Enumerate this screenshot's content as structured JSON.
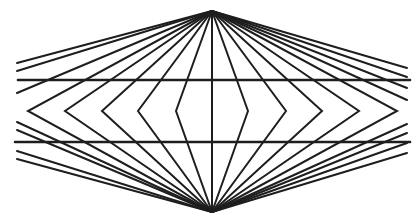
{
  "colors": {
    "stroke": "#1e1e1e",
    "background": "#ffffff"
  },
  "apex_top": [
    212,
    11
  ],
  "apex_bottom": [
    212,
    212
  ],
  "horizontal_lines": [
    {
      "y": 80,
      "x1": 18,
      "x2": 410
    },
    {
      "y": 142,
      "x1": 15,
      "x2": 410
    }
  ],
  "chevrons": {
    "mid_y": 111,
    "left_apex_x": [
      28,
      65,
      102,
      138,
      176
    ],
    "center_x": 212,
    "right_apex_x": [
      248,
      286,
      322,
      359,
      397
    ]
  },
  "outer_rays": {
    "top_left": [
      [
        17,
        63
      ],
      [
        17,
        71
      ],
      [
        17,
        93
      ]
    ],
    "top_right": [
      [
        407,
        68
      ],
      [
        407,
        77
      ],
      [
        407,
        88
      ],
      [
        407,
        100
      ]
    ],
    "bottom_left": [
      [
        17,
        122
      ],
      [
        17,
        130
      ],
      [
        17,
        151
      ],
      [
        17,
        159
      ]
    ],
    "bottom_right": [
      [
        407,
        124
      ],
      [
        407,
        133
      ],
      [
        407,
        143
      ],
      [
        407,
        153
      ]
    ]
  }
}
